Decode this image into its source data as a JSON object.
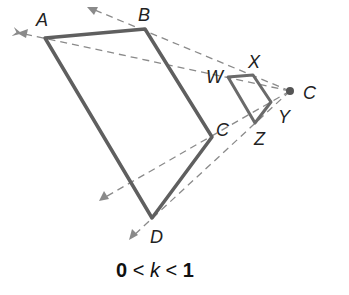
{
  "diagram": {
    "type": "dilation",
    "caption": {
      "left": "0",
      "op1": " < ",
      "var": "k",
      "op2": " < ",
      "right": "1"
    },
    "center": {
      "label": "C",
      "x": 290,
      "y": 91
    },
    "original": {
      "vertices": [
        {
          "label": "A",
          "x": 45,
          "y": 38
        },
        {
          "label": "B",
          "x": 145,
          "y": 29
        },
        {
          "label": "C",
          "x": 212,
          "y": 137
        },
        {
          "label": "D",
          "x": 152,
          "y": 218
        }
      ]
    },
    "image": {
      "vertices": [
        {
          "label": "W",
          "x": 228,
          "y": 77
        },
        {
          "label": "X",
          "x": 253,
          "y": 75
        },
        {
          "label": "Y",
          "x": 271,
          "y": 102
        },
        {
          "label": "Z",
          "x": 255,
          "y": 123
        }
      ]
    },
    "rays": [
      {
        "to": "A",
        "end_x": 18,
        "end_y": 33
      },
      {
        "to": "B",
        "end_x": 88,
        "end_y": 7
      },
      {
        "to": "C",
        "end_x": 100,
        "end_y": 200
      },
      {
        "to": "D",
        "end_x": 130,
        "end_y": 238
      }
    ],
    "colors": {
      "shape": "#5f5f5f",
      "ray": "#8a8a8a",
      "center": "#555555"
    }
  }
}
